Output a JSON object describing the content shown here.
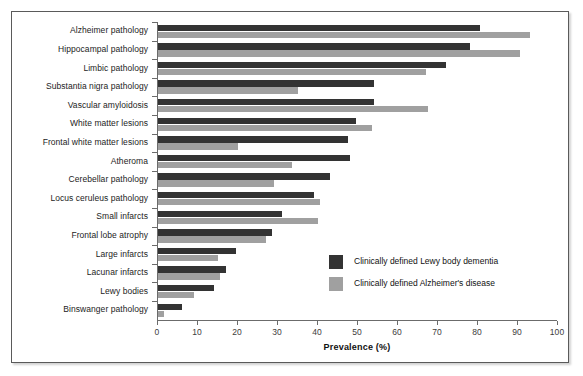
{
  "chart_data": {
    "type": "bar",
    "orientation": "horizontal",
    "title": "",
    "xlabel": "Prevalence (%)",
    "ylabel": "",
    "xlim": [
      0,
      100
    ],
    "xticks": [
      0,
      10,
      20,
      30,
      40,
      50,
      60,
      70,
      80,
      90,
      100
    ],
    "grid": false,
    "legend_position": "inside-right-lower",
    "categories": [
      "Alzheimer pathology",
      "Hippocampal pathology",
      "Limbic pathology",
      "Substantia nigra pathology",
      "Vascular amyloidosis",
      "White matter lesions",
      "Frontal white matter lesions",
      "Atheroma",
      "Cerebellar pathology",
      "Locus ceruleus pathology",
      "Small infarcts",
      "Frontal lobe atrophy",
      "Large infarcts",
      "Lacunar infarcts",
      "Lewy bodies",
      "Binswanger pathology"
    ],
    "series": [
      {
        "name": "Clinically defined Lewy body dementia",
        "color": "#333333",
        "values": [
          80.5,
          78,
          72,
          54,
          54,
          49.5,
          47.5,
          48,
          43,
          39,
          31,
          28.5,
          19.5,
          17,
          14,
          6
        ]
      },
      {
        "name": "Clinically defined Alzheimer's disease",
        "color": "#a0a0a0",
        "values": [
          93,
          90.5,
          67,
          35,
          67.5,
          53.5,
          20,
          33.5,
          29,
          40.5,
          40,
          27,
          15,
          15.5,
          9,
          1.5
        ]
      }
    ]
  },
  "legend": {
    "items": [
      {
        "label": "Clinically defined Lewy body dementia",
        "color": "#333333"
      },
      {
        "label": "Clinically defined Alzheimer's disease",
        "color": "#a0a0a0"
      }
    ]
  },
  "axis": {
    "x_title": "Prevalence (%)",
    "tick_labels": [
      "0",
      "10",
      "20",
      "30",
      "40",
      "50",
      "60",
      "70",
      "80",
      "90",
      "100"
    ]
  }
}
